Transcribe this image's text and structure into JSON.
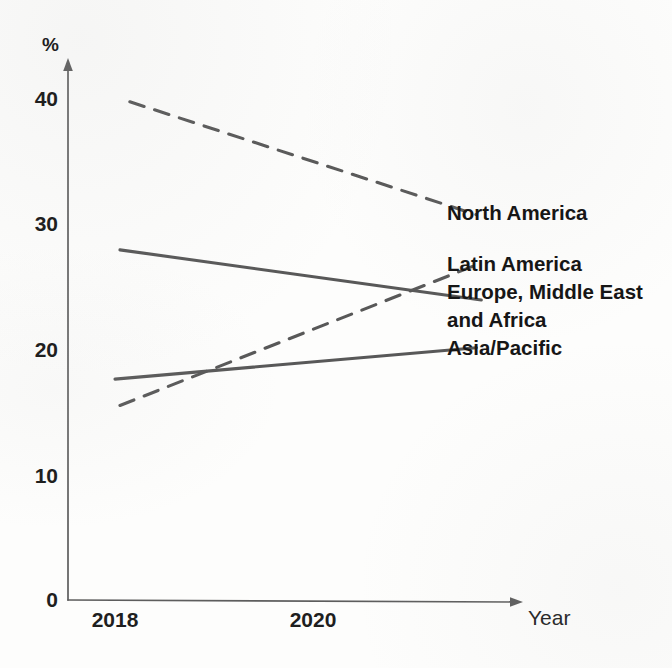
{
  "chart_data": {
    "type": "line",
    "title": "",
    "subtitle": "",
    "xlabel": "Year",
    "ylabel": "%",
    "x": [
      2018,
      2022
    ],
    "xlim": [
      2018,
      2022.6
    ],
    "ylim": [
      0,
      43
    ],
    "grid": false,
    "legend_position": "inline-right",
    "xticks": [
      "2018",
      "2020"
    ],
    "xtick_values": [
      2018,
      2020
    ],
    "yticks": [
      "0",
      "10",
      "20",
      "30",
      "40"
    ],
    "ytick_values": [
      0,
      10,
      20,
      30,
      40
    ],
    "series": [
      {
        "name": "North America",
        "style": "dashed",
        "color": "#585858",
        "x": [
          2018.15,
          2021.65
        ],
        "values": [
          39.7,
          30.7
        ]
      },
      {
        "name": "Latin America",
        "style": "dashed",
        "color": "#585858",
        "x": [
          2018.05,
          2021.65
        ],
        "values": [
          15.5,
          26.7
        ]
      },
      {
        "name": "Europe, Middle East and Africa",
        "style": "solid",
        "color": "#585858",
        "x": [
          2018.05,
          2021.7
        ],
        "values": [
          27.9,
          23.9
        ]
      },
      {
        "name": "Asia/Pacific",
        "style": "solid",
        "color": "#585858",
        "x": [
          2018.0,
          2021.65
        ],
        "values": [
          17.6,
          20.1
        ]
      }
    ],
    "annotations": []
  },
  "axes": {
    "y_unit_label": "%",
    "x_axis_label": "Year",
    "y_tick_0": "0",
    "y_tick_10": "10",
    "y_tick_20": "20",
    "y_tick_30": "30",
    "y_tick_40": "40",
    "x_tick_2018": "2018",
    "x_tick_2020": "2020"
  },
  "labels": {
    "north_america": "North America",
    "latin_america": "Latin America",
    "emea_line1": "Europe, Middle East",
    "emea_line2": "and Africa",
    "asia_pacific": "Asia/Pacific"
  },
  "colors": {
    "ink": "#1f1f1f",
    "line": "#585858",
    "axis": "#5d5d5d",
    "background": "#fdfdfc"
  }
}
